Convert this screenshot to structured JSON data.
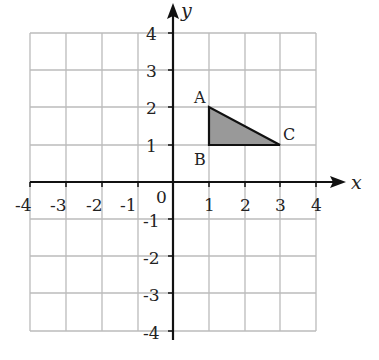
{
  "diagram": {
    "type": "coordinate-plane",
    "x_range": [
      -4,
      4
    ],
    "y_range": [
      -4,
      4
    ],
    "axis_labels": {
      "x": "x",
      "y": "y"
    },
    "origin_label": "0",
    "x_ticks": [
      "-4",
      "-3",
      "-2",
      "-1",
      "1",
      "2",
      "3",
      "4"
    ],
    "y_ticks": [
      "4",
      "3",
      "2",
      "1",
      "-1",
      "-2",
      "-3",
      "-4"
    ],
    "triangle": {
      "fill_color": "#999999",
      "stroke_color": "#111111",
      "vertices": [
        {
          "label": "A",
          "x": 1,
          "y": 2
        },
        {
          "label": "B",
          "x": 1,
          "y": 1
        },
        {
          "label": "C",
          "x": 3,
          "y": 1
        }
      ]
    },
    "colors": {
      "grid": "#bbbbbb",
      "axis": "#111111"
    }
  }
}
